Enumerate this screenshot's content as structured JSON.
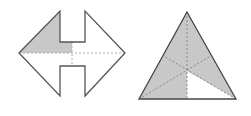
{
  "figures": [
    {
      "id": "double-arrow",
      "description": "Double-headed arrow shape with one-eighth shaded",
      "outline_color": "#555555",
      "fill_color": "#c8c8c8",
      "guide_color": "#999999",
      "shaded_fraction": "1/8"
    },
    {
      "id": "triangle",
      "description": "Equilateral triangle divided by medians, five-sixths shaded",
      "outline_color": "#444444",
      "fill_color": "#c8c8c8",
      "guide_color": "#888888",
      "shaded_fraction": "5/6"
    }
  ]
}
